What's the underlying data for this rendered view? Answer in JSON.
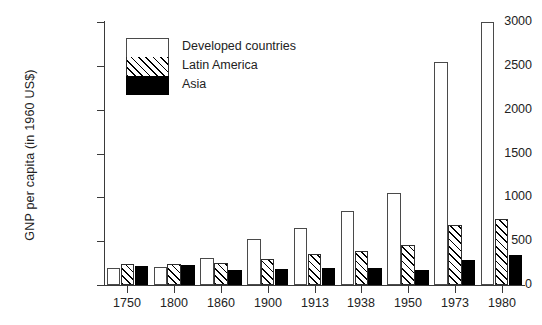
{
  "chart_data": {
    "type": "bar",
    "title": "",
    "xlabel": "",
    "ylabel": "GNP per capita (in 1960 US$)",
    "ylim": [
      0,
      3000
    ],
    "yticks": [
      0,
      500,
      1000,
      1500,
      2000,
      2500,
      3000
    ],
    "ytick_labels": [
      "0",
      "500",
      "1000",
      "1500",
      "2000",
      "2500",
      "3000"
    ],
    "grid": false,
    "legend_position": "upper-left-inside",
    "categories": [
      "1750",
      "1800",
      "1860",
      "1900",
      "1913",
      "1938",
      "1950",
      "1973",
      "1980"
    ],
    "series": [
      {
        "name": "Developed countries",
        "fill": "white",
        "color": "#ffffff",
        "edge_color": "#4a4a4a",
        "values": [
          190,
          200,
          310,
          525,
          650,
          840,
          1055,
          2540,
          3000
        ]
      },
      {
        "name": "Latin America",
        "fill": "diagonal-hatch",
        "color": "#ffffff",
        "edge_color": "#2e2e2e",
        "values": [
          240,
          245,
          250,
          300,
          355,
          390,
          455,
          690,
          755
        ]
      },
      {
        "name": "Asia",
        "fill": "solid",
        "color": "#000000",
        "edge_color": "#000000",
        "values": [
          215,
          225,
          175,
          185,
          195,
          190,
          175,
          290,
          345
        ]
      }
    ]
  },
  "legend": {
    "items": [
      {
        "label": "Developed countries",
        "swatch": "developed"
      },
      {
        "label": "Latin America",
        "swatch": "latin"
      },
      {
        "label": "Asia",
        "swatch": "asia"
      }
    ]
  }
}
